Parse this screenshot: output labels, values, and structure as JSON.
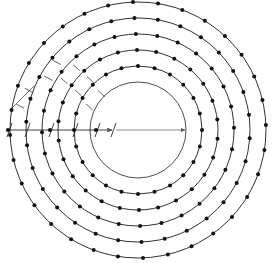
{
  "figure": {
    "type": "engineering-dimension-diagram",
    "center_dimension": "340",
    "radial_chain_dimensions": [
      "60",
      "80",
      "80",
      "75",
      "70"
    ],
    "diagonal_dimensions": [
      "50",
      "100",
      "100",
      "90",
      "80"
    ],
    "station_labels_upper": [
      "MS11",
      "MS9",
      "MS7",
      "MS5",
      "MS1"
    ],
    "station_labels_lower": [
      "MS3",
      "MS6",
      "MS8",
      "MS10",
      "MS12"
    ],
    "colors": {
      "line": "#1a1a1a",
      "node": "#111111",
      "dimension": "#5a5a5a",
      "background": "#ffffff"
    }
  },
  "chart_data": {
    "type": "scatter",
    "xlabel": "",
    "ylabel": "",
    "grid": false,
    "legend": "none",
    "center": {
      "x": 138,
      "y": 130
    },
    "inner_circle_radius_px": 48,
    "center_radius_label": "340",
    "rings": [
      {
        "name": "MS1",
        "pair_label_lower": "MS3",
        "radius_px": 64,
        "node_count": 24,
        "gap_dimension": "70"
      },
      {
        "name": "MS5",
        "pair_label_lower": "MS6",
        "radius_px": 80,
        "node_count": 26,
        "gap_dimension": "75"
      },
      {
        "name": "MS7",
        "pair_label_lower": "MS8",
        "radius_px": 96,
        "node_count": 28,
        "gap_dimension": "80"
      },
      {
        "name": "MS9",
        "pair_label_lower": "MS10",
        "radius_px": 112,
        "node_count": 30,
        "gap_dimension": "80"
      },
      {
        "name": "MS11",
        "pair_label_lower": "MS12",
        "radius_px": 128,
        "node_count": 32,
        "gap_dimension": "60"
      }
    ],
    "horizontal_chain": [
      {
        "label": "60",
        "x": 17
      },
      {
        "label": "80",
        "x": 40
      },
      {
        "label": "80",
        "x": 63
      },
      {
        "label": "75",
        "x": 85
      },
      {
        "label": "70",
        "x": 103
      }
    ],
    "diagonal_chain": [
      {
        "label": "50",
        "rotation": -62
      },
      {
        "label": "100",
        "rotation": -62
      },
      {
        "label": "100",
        "rotation": -48
      },
      {
        "label": "90",
        "rotation": -48
      },
      {
        "label": "80",
        "rotation": -48
      }
    ]
  }
}
